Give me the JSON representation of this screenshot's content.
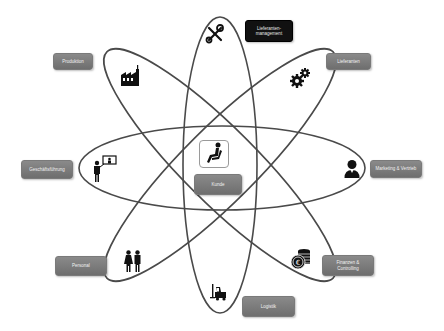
{
  "diagram": {
    "type": "atom-orbit-diagram",
    "center": {
      "label": "Kunde",
      "icon": "seated-person-icon"
    },
    "nodes": [
      {
        "id": "lieferanten-management",
        "label": "Lieferanten-management",
        "icon": "wrench-screwdriver-icon",
        "style": "dark"
      },
      {
        "id": "produktion",
        "label": "Produktion",
        "icon": "factory-icon",
        "style": "gray"
      },
      {
        "id": "lieferanten",
        "label": "Lieferanten",
        "icon": "gears-icon",
        "style": "gray"
      },
      {
        "id": "geschaeftsfuehrung",
        "label": "Geschäftsführung",
        "icon": "presenter-icon",
        "style": "gray"
      },
      {
        "id": "marketing-vertrieb",
        "label": "Marketing & Vertrieb",
        "icon": "user-icon",
        "style": "gray"
      },
      {
        "id": "personal",
        "label": "Personal",
        "icon": "people-icon",
        "style": "gray"
      },
      {
        "id": "finanzen-controlling",
        "label": "Finanzen & Controlling",
        "icon": "coins-euro-icon",
        "style": "gray"
      },
      {
        "id": "logistik",
        "label": "Logistik",
        "icon": "forklift-icon",
        "style": "gray"
      }
    ],
    "orbit_count": 4,
    "colors": {
      "orbit": "#4a4a4a",
      "box_gray": "#7c7c7c",
      "box_dark": "#111111",
      "box_text": "#f2f2f2"
    }
  }
}
